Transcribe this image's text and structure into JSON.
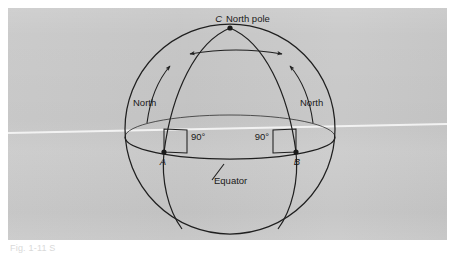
{
  "figure": {
    "kind": "geometry-diagram",
    "panel_color": "#c8c8c8",
    "ink_color": "#1f1f1f",
    "caption": "Fig. 1-11 S"
  },
  "labels": {
    "pole_point": "C",
    "pole_text": "North pole",
    "point_a": "A",
    "point_b": "B",
    "angle_left": "90°",
    "angle_right": "90°",
    "north_left": "North",
    "north_right": "North",
    "equator": "Equator"
  },
  "geometry": {
    "sphere": {
      "cx": 230,
      "cy": 129,
      "r": 105
    },
    "pole": {
      "x": 230,
      "y": 28
    },
    "point_a": {
      "x": 164,
      "y": 152
    },
    "point_b": {
      "x": 296,
      "y": 152
    },
    "equator_label_anchor": {
      "x": 215,
      "y": 182
    },
    "arc_arrow": {
      "x1": 190,
      "y1": 53,
      "x2": 282,
      "y2": 53
    }
  }
}
